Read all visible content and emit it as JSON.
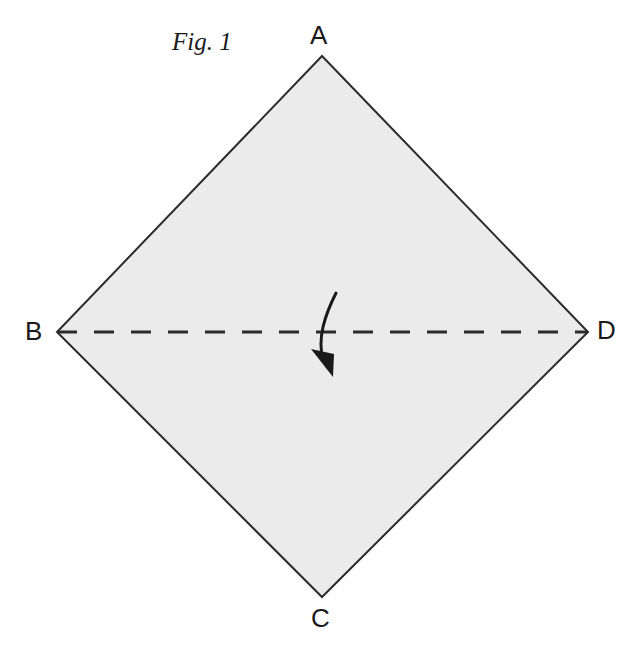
{
  "figure": {
    "caption": "Fig. 1",
    "background_color": "#ffffff",
    "shape": {
      "name": "rhombus",
      "fill_color": "#ebebeb",
      "stroke_color": "#2b2b2b",
      "stroke_width": 2,
      "vertices": [
        {
          "label": "A",
          "x": 322,
          "y": 56
        },
        {
          "label": "D",
          "x": 588,
          "y": 332
        },
        {
          "label": "C",
          "x": 322,
          "y": 597
        },
        {
          "label": "B",
          "x": 57,
          "y": 332
        }
      ]
    },
    "axis": {
      "name": "fold-axis-bd",
      "style": "dashed",
      "from": "B",
      "to": "D",
      "x1": 57,
      "y1": 332,
      "x2": 588,
      "y2": 332,
      "dash_length": 20,
      "gap_length": 17,
      "stroke_color": "#2b2b2b",
      "stroke_width": 3
    },
    "arrow": {
      "name": "fold-direction-arrow",
      "description": "curved arrow indicating fold direction downward",
      "stroke_color": "#1a1a1a",
      "stroke_width": 3,
      "start_x": 336,
      "start_y": 293,
      "end_x": 333,
      "end_y": 375
    },
    "labels": {
      "a": "A",
      "b": "B",
      "c": "C",
      "d": "D"
    }
  }
}
